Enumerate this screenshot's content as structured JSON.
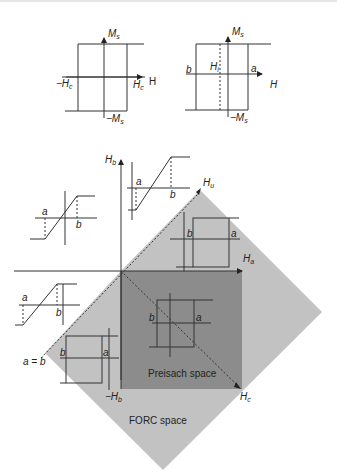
{
  "figure": {
    "type": "hysteron_preisach_forc_diagram",
    "colors": {
      "forc_space_fill": "#c2c2c2",
      "preisach_space_fill": "#8c8c8c",
      "line": "#333333",
      "background": "#ffffff"
    }
  },
  "top_left_loop": {
    "axis_y_label": "M",
    "axis_y_sub": "s",
    "axis_x_label": "H",
    "neg_hc_label": "−H",
    "neg_hc_sub": "c",
    "hc_label": "H",
    "hc_sub": "c",
    "neg_ms_label": "−M",
    "neg_ms_sub": "s"
  },
  "top_right_loop": {
    "axis_y_label": "M",
    "axis_y_sub": "s",
    "axis_x_label": "H",
    "hi_label": "H",
    "hi_sub": "i",
    "b_label": "b",
    "a_label": "a",
    "neg_ms_label": "−M",
    "neg_ms_sub": "s"
  },
  "main_plane": {
    "hb_axis_label": "H",
    "hb_axis_sub": "b",
    "ha_axis_label": "H",
    "ha_axis_sub": "a",
    "hu_axis_label": "H",
    "hu_axis_sub": "u",
    "hc_axis_label": "H",
    "hc_axis_sub": "c",
    "neg_hb_label": "−H",
    "neg_hb_sub": "b",
    "a_eq_b_label": "a = b",
    "preisach_label": "Preisach space",
    "forc_label": "FORC space"
  },
  "insets": {
    "upper_left": {
      "a": "a",
      "b": "b"
    },
    "upper_mid": {
      "a": "a",
      "b": "b"
    },
    "right_loop": {
      "a": "a",
      "b": "b"
    },
    "left_ramp": {
      "a": "a",
      "b": "b"
    },
    "center_loop": {
      "a": "a",
      "b": "b"
    },
    "lower_left_loop": {
      "a": "a",
      "b": "b"
    }
  }
}
